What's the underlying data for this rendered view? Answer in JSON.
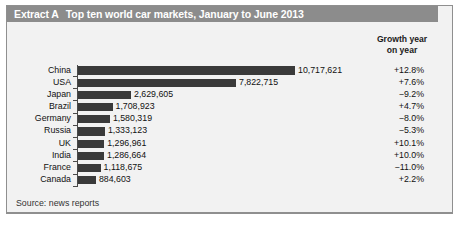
{
  "exhibit": {
    "label": "Extract A",
    "title": "Top ten world car markets, January to June 2013",
    "source": "Source: news reports",
    "growth_header_line1": "Growth year",
    "growth_header_line2": "on year",
    "accent_band_color": "#8c8c8c",
    "bar_color": "#3a3a3a",
    "panel_bg_color": "#f2f2f2"
  },
  "chart_data": {
    "type": "bar",
    "title": "Top ten world car markets, January to June 2013",
    "orientation": "horizontal",
    "xlabel": "",
    "ylabel": "",
    "xlim": [
      0,
      11000000
    ],
    "grid": false,
    "legend": "none",
    "categories": [
      "China",
      "USA",
      "Japan",
      "Brazil",
      "Germany",
      "Russia",
      "UK",
      "India",
      "France",
      "Canada"
    ],
    "values": [
      10717621,
      7822715,
      2629605,
      1708923,
      1580319,
      1333123,
      1296961,
      1286664,
      1118675,
      884603
    ],
    "value_labels": [
      "10,717,621",
      "7,822,715",
      "2,629,605",
      "1,708,923",
      "1,580,319",
      "1,333,123",
      "1,296,961",
      "1,286,664",
      "1,118,675",
      "884,603"
    ],
    "annotations": {
      "name": "Growth year on year",
      "values": [
        "+12.8%",
        "+7.6%",
        "−9.2%",
        "+4.7%",
        "−8.0%",
        "−5.3%",
        "+10.1%",
        "+10.0%",
        "−11.0%",
        "+2.2%"
      ]
    }
  }
}
